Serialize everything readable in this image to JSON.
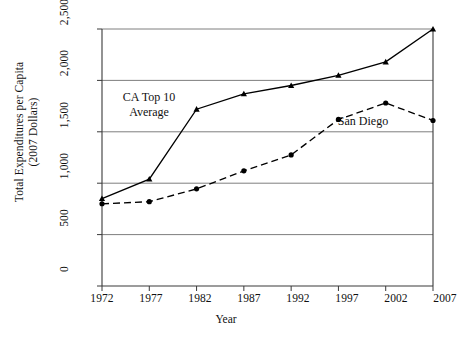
{
  "chart_data": {
    "type": "line",
    "title": "",
    "xlabel": "Year",
    "ylabel_line1": "Total Expenditures per Capita",
    "ylabel_line2": "(2007 Dollars)",
    "categories": [
      "1972",
      "1977",
      "1982",
      "1987",
      "1992",
      "1997",
      "2002",
      "2007"
    ],
    "x": [
      1972,
      1977,
      1982,
      1987,
      1992,
      1997,
      2002,
      2007
    ],
    "xlim": [
      1972,
      2007
    ],
    "ylim": [
      0,
      2500
    ],
    "yticks": [
      "0",
      "500",
      "1,000",
      "1,500",
      "2,000",
      "2,500"
    ],
    "ytick_values": [
      0,
      500,
      1000,
      1500,
      2000,
      2500
    ],
    "grid": true,
    "legend_position": "inline-annotations",
    "series": [
      {
        "name": "CA Top 10 Average",
        "label_line1": "CA Top 10",
        "label_line2": "Average",
        "style": "solid",
        "marker": "triangle",
        "color": "#000000",
        "values": [
          850,
          1040,
          1720,
          1870,
          1950,
          2050,
          2180,
          2500
        ]
      },
      {
        "name": "San Diego",
        "label_line1": "San Diego",
        "label_line2": "",
        "style": "dashed",
        "marker": "circle",
        "color": "#000000",
        "values": [
          800,
          820,
          945,
          1120,
          1275,
          1620,
          1780,
          1610
        ]
      }
    ]
  }
}
